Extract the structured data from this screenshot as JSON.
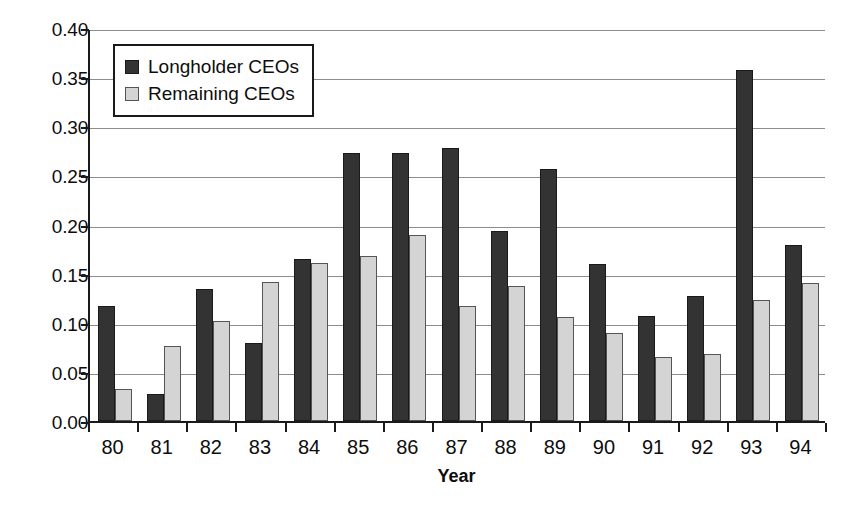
{
  "chart_data": {
    "type": "bar",
    "title": "",
    "subtitle": "",
    "xlabel": "Year",
    "ylabel": "",
    "ylim": [
      0.0,
      0.4
    ],
    "ytick_step": 0.05,
    "ytick_labels": [
      "0.40",
      "0.35",
      "0.30",
      "0.25",
      "0.20",
      "0.15",
      "0.10",
      "0.05",
      "0.00"
    ],
    "ytick_values": [
      0.4,
      0.35,
      0.3,
      0.25,
      0.2,
      0.15,
      0.1,
      0.05,
      0.0
    ],
    "grid": "horizontal",
    "legend_position": "upper-left-inside",
    "categories": [
      "80",
      "81",
      "82",
      "83",
      "84",
      "85",
      "86",
      "87",
      "88",
      "89",
      "90",
      "91",
      "92",
      "93",
      "94"
    ],
    "series": [
      {
        "name": "Longholder CEOs",
        "color": "#333333",
        "values": [
          0.117,
          0.027,
          0.134,
          0.079,
          0.165,
          0.273,
          0.273,
          0.278,
          0.193,
          0.257,
          0.16,
          0.107,
          0.127,
          0.357,
          0.179
        ]
      },
      {
        "name": "Remaining CEOs",
        "color": "#d4d4d4",
        "values": [
          0.033,
          0.076,
          0.102,
          0.141,
          0.161,
          0.168,
          0.189,
          0.117,
          0.137,
          0.106,
          0.09,
          0.065,
          0.068,
          0.123,
          0.14
        ]
      }
    ],
    "annotations": []
  },
  "legend": {
    "items": [
      {
        "label": "Longholder CEOs",
        "swatch": "dark-square-swatch"
      },
      {
        "label": "Remaining CEOs",
        "swatch": "light-square-swatch"
      }
    ]
  },
  "axes": {
    "x_title": "Year"
  }
}
